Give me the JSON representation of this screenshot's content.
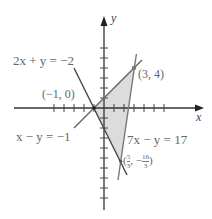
{
  "diagram": {
    "type": "feasible-region-plot",
    "axes": {
      "x_label": "x",
      "y_label": "y",
      "x_ticks": [
        -5,
        -4,
        -3,
        -2,
        -1,
        1,
        2,
        3,
        4,
        5,
        6
      ],
      "y_ticks": [
        -10,
        -9,
        -8,
        -7,
        -6,
        -5,
        -4,
        -3,
        -2,
        -1,
        1,
        2,
        3,
        4,
        5,
        6
      ]
    },
    "lines": [
      {
        "id": "line1",
        "equation": "2x + y = −2",
        "color": "#555555"
      },
      {
        "id": "line2",
        "equation": "x − y = −1",
        "color": "#555555"
      },
      {
        "id": "line3",
        "equation": "7x − y = 17",
        "color": "#777777"
      }
    ],
    "vertices": [
      {
        "label": "(−1, 0)",
        "x": -1,
        "y": 0
      },
      {
        "label": "(3, 4)",
        "x": 3,
        "y": 4
      },
      {
        "label_num_x": "5",
        "label_den_x": "3",
        "label_num_y": "16",
        "label_den_y": "3",
        "label_prefix": "(",
        "label_sep": ", −",
        "label_suffix": ")",
        "x": 1.667,
        "y": -5.333
      }
    ],
    "region_fill": "#d9d9d9",
    "point_color": "#888888"
  }
}
